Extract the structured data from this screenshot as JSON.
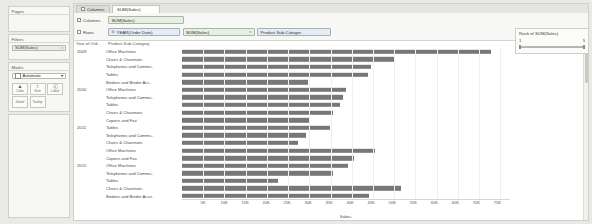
{
  "left_panel": {
    "pages": {
      "title": "Pages"
    },
    "filters": {
      "title": "Filters",
      "pill": "SUM(Sales)",
      "caret": "▾"
    },
    "marks": {
      "title": "Marks",
      "type_label": "Automatic",
      "type_caret": "▾",
      "shelves": [
        {
          "name": "color-shelf",
          "glyph": "▲",
          "label": "Color"
        },
        {
          "name": "size-shelf",
          "glyph": "↕",
          "label": "Size"
        },
        {
          "name": "label-shelf",
          "glyph": "Ⓛ",
          "label": "Label"
        },
        {
          "name": "detail-shelf",
          "glyph": "",
          "label": "Detail"
        },
        {
          "name": "tooltip-shelf",
          "glyph": "",
          "label": "Tooltip"
        }
      ]
    }
  },
  "tabs": [
    {
      "label": "Columns",
      "icon": "grid-icon",
      "active": false
    },
    {
      "label": "SUM(Sales)",
      "active": true
    }
  ],
  "shelves": {
    "columns": {
      "label": "Columns",
      "pills": [
        {
          "text": "SUM(Sales)",
          "kind": "green",
          "lead": "",
          "caret": ""
        }
      ]
    },
    "rows": {
      "label": "Rows",
      "pills": [
        {
          "text": "YEAR(Order Date)",
          "kind": "blue",
          "lead": "⊞",
          "caret": ""
        },
        {
          "text": "SUM(Sales)",
          "kind": "green",
          "lead": "",
          "caret": "▾"
        },
        {
          "text": "Product Sub-Categor..",
          "kind": "blue",
          "lead": "",
          "caret": ""
        }
      ]
    }
  },
  "viz": {
    "header_year": "Year of Ord..",
    "header_sub": "Product Sub-Category",
    "axis_title": "Sales",
    "axis_title_suffix": "↓"
  },
  "right_card": {
    "title": "Rank of SUM(Sales)",
    "min": "1",
    "max": "5",
    "caret": "▸"
  },
  "chart_data": {
    "type": "bar",
    "xlabel": "Sales",
    "ylabel": "",
    "xlim": [
      0,
      78000
    ],
    "xticks": [
      5000,
      10000,
      15000,
      20000,
      25000,
      30000,
      35000,
      40000,
      45000,
      50000,
      55000,
      60000,
      65000,
      70000,
      75000
    ],
    "xticklabels": [
      "5K",
      "10K",
      "15K",
      "20K",
      "25K",
      "30K",
      "35K",
      "40K",
      "45K",
      "50K",
      "55K",
      "60K",
      "65K",
      "70K",
      "75K"
    ],
    "grid": true,
    "legend": "none",
    "orientation": "horizontal",
    "bar_color": "#77777a",
    "groups": [
      {
        "year": "2009",
        "rows": [
          {
            "label": "Office Machines",
            "value": 73500
          },
          {
            "label": "Chairs & Chairmats",
            "value": 50500
          },
          {
            "label": "Telephones and Commu..",
            "value": 45000
          },
          {
            "label": "Tables",
            "value": 44300
          },
          {
            "label": "Binders and Binder Acc..",
            "value": 30000
          }
        ]
      },
      {
        "year": "2010",
        "rows": [
          {
            "label": "Office Machines",
            "value": 38900
          },
          {
            "label": "Telephones and Commu..",
            "value": 38200
          },
          {
            "label": "Tables",
            "value": 37600
          },
          {
            "label": "Chairs & Chairmats",
            "value": 36000
          },
          {
            "label": "Copiers and Fax",
            "value": 30500
          }
        ]
      },
      {
        "year": "2011",
        "rows": [
          {
            "label": "Tables",
            "value": 35300
          },
          {
            "label": "Telephones and Commu..",
            "value": 29400
          },
          {
            "label": "Chairs & Chairmats",
            "value": 27500
          },
          {
            "label": "Office Machines",
            "value": 46000
          },
          {
            "label": "Copiers and Fax",
            "value": 41000
          }
        ]
      },
      {
        "year": "2012",
        "rows": [
          {
            "label": "Office Machines",
            "value": 39500
          },
          {
            "label": "Telephones and Commu..",
            "value": 36000
          },
          {
            "label": "Tables",
            "value": 22800
          },
          {
            "label": "Chairs & Chairmats",
            "value": 52000
          },
          {
            "label": "Binders and Binder Acce..",
            "value": 44500
          }
        ]
      }
    ]
  }
}
